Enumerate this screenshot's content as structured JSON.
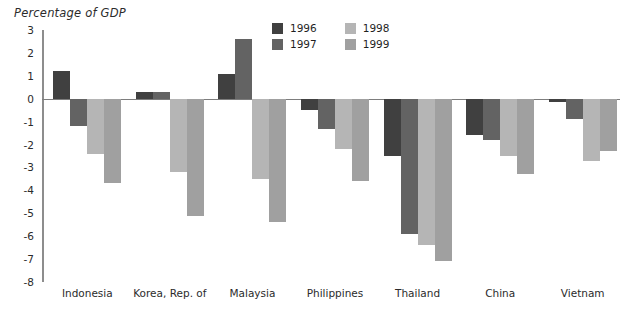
{
  "chart_data": {
    "type": "bar",
    "title": "Percentage of GDP",
    "subtitle": "",
    "xlabel": "",
    "ylabel": "Percentage of GDP",
    "ylim": [
      -8,
      3
    ],
    "yticks": [
      3,
      2,
      1,
      0,
      -1,
      -2,
      -3,
      -4,
      -5,
      -6,
      -7,
      -8
    ],
    "ytick_labels": [
      "3",
      "2",
      "1",
      "0",
      "-1",
      "-2",
      "-3",
      "-4",
      "-5",
      "-6",
      "-7",
      "-8"
    ],
    "grid": false,
    "legend_position": "top-right",
    "orientation": "vertical",
    "grouped": true,
    "categories": [
      "Indonesia",
      "Korea, Rep. of",
      "Malaysia",
      "Philippines",
      "Thailand",
      "China",
      "Vietnam"
    ],
    "series": [
      {
        "name": "1996",
        "color": "#404040",
        "values": [
          1.2,
          0.3,
          1.1,
          -0.5,
          -2.5,
          -1.6,
          -0.15
        ]
      },
      {
        "name": "1997",
        "color": "#636363",
        "values": [
          -1.2,
          0.3,
          2.6,
          -1.3,
          -5.9,
          -1.8,
          -0.9
        ]
      },
      {
        "name": "1998",
        "color": "#b5b5b5",
        "values": [
          -2.4,
          -3.2,
          -3.5,
          -2.2,
          -6.4,
          -2.5,
          -2.7
        ]
      },
      {
        "name": "1999",
        "color": "#a0a0a0",
        "values": [
          -3.7,
          -5.1,
          -5.4,
          -3.6,
          -7.1,
          -3.3,
          -2.3
        ]
      }
    ]
  },
  "legend": {
    "entries": [
      {
        "label": "1996",
        "color": "#404040"
      },
      {
        "label": "1998",
        "color": "#b5b5b5"
      },
      {
        "label": "1997",
        "color": "#636363"
      },
      {
        "label": "1999",
        "color": "#a0a0a0"
      }
    ]
  },
  "axis": {
    "line_color": "#8d8d8d",
    "zero_line_color": "#7d7d7d"
  }
}
